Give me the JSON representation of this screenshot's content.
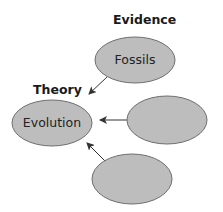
{
  "diagram": {
    "headings": {
      "evidence": "Evidence",
      "theory": "Theory"
    },
    "nodes": [
      {
        "id": "theory",
        "label": "Evolution",
        "cx": 52,
        "cy": 123,
        "rx": 40,
        "ry": 23
      },
      {
        "id": "evidence-1",
        "label": "Fossils",
        "cx": 135,
        "cy": 60,
        "rx": 40,
        "ry": 23
      },
      {
        "id": "evidence-2",
        "label": "",
        "cx": 167,
        "cy": 120,
        "rx": 40,
        "ry": 24
      },
      {
        "id": "evidence-3",
        "label": "",
        "cx": 132,
        "cy": 179,
        "rx": 40,
        "ry": 25
      }
    ],
    "edges": [
      {
        "from": "evidence-1",
        "to": "theory"
      },
      {
        "from": "evidence-2",
        "to": "theory"
      },
      {
        "from": "evidence-3",
        "to": "theory"
      }
    ],
    "colors": {
      "node_fill": "#bdbdbd",
      "node_stroke": "#6e6e6e",
      "arrow": "#333333"
    }
  }
}
